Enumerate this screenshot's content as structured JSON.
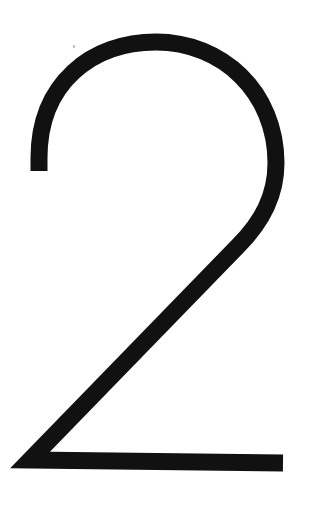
{
  "figure": {
    "glyph": "2",
    "stroke_color": "#111111",
    "background_color": "#ffffff"
  }
}
